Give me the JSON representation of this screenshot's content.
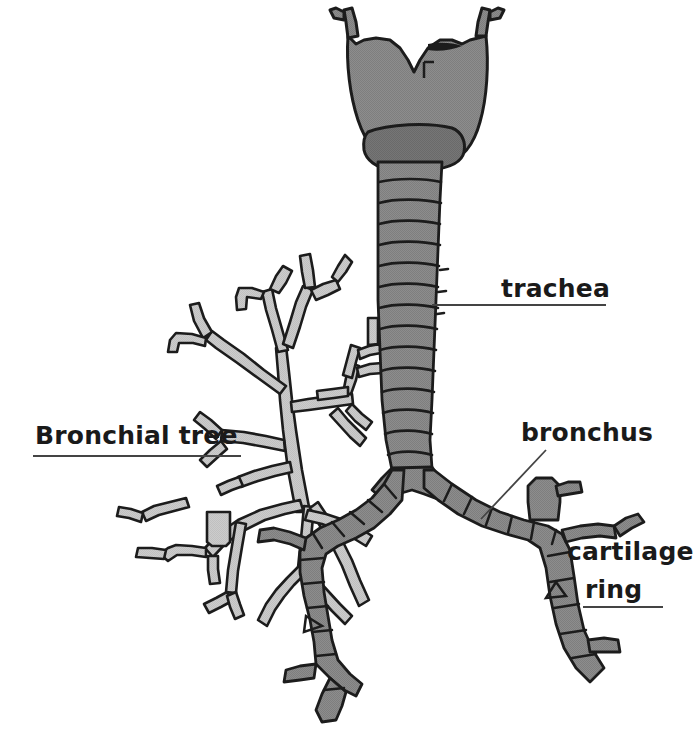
{
  "figure": {
    "width": 696,
    "height": 752,
    "background_color": "#ffffff"
  },
  "colors": {
    "background": "#ffffff",
    "trachea_fill": "#8a8a8a",
    "trachea_fill_light": "#9a9a9a",
    "larynx_fill": "#939393",
    "bronchial_tree_fill": "#c9c9c9",
    "outline": "#1c1c1c",
    "label_text": "#1a1a1a",
    "leader_line": "#444444"
  },
  "labels": [
    {
      "id": "trachea",
      "text": "trachea",
      "style": "plain",
      "x": 501,
      "y": 276,
      "leader": {
        "type": "horizontal",
        "x": 432,
        "y": 304,
        "length": 174
      }
    },
    {
      "id": "bronchial-tree",
      "text": "Bronchial tree",
      "style": "bold",
      "x": 35,
      "y": 423,
      "leader": {
        "type": "horizontal",
        "x": 33,
        "y": 455,
        "length": 208
      }
    },
    {
      "id": "bronchus",
      "text": "bronchus",
      "style": "plain",
      "x": 521,
      "y": 420,
      "leader": {
        "type": "diagonal",
        "x1": 546,
        "y1": 450,
        "x2": 481,
        "y2": 519
      }
    },
    {
      "id": "cartilage-ring",
      "text": "cartilage",
      "text_line2": "ring",
      "style": "plain",
      "x": 567,
      "y": 539,
      "y2": 577,
      "leader": {
        "type": "horizontal",
        "x": 583,
        "y": 606,
        "length": 80
      }
    }
  ],
  "anatomy": {
    "structures": [
      {
        "name": "larynx",
        "label": "Larynx / thyroid cartilage",
        "fill": "#939393"
      },
      {
        "name": "cricoid-cartilage",
        "label": "Cricoid cartilage",
        "fill": "#9a9a9a"
      },
      {
        "name": "trachea",
        "label": "Trachea with cartilage rings",
        "fill": "#8a8a8a",
        "ring_count": 16
      },
      {
        "name": "carina",
        "label": "Carina (bifurcation)",
        "fill": "#8a8a8a"
      },
      {
        "name": "right-main-bronchus",
        "label": "Right main bronchus",
        "fill": "#8a8a8a",
        "ring_count": 9
      },
      {
        "name": "left-main-bronchus",
        "label": "Left main bronchus",
        "fill": "#8a8a8a",
        "ring_count": 8
      },
      {
        "name": "bronchial-tree",
        "label": "Bronchial tree branches",
        "fill": "#c9c9c9"
      }
    ]
  }
}
